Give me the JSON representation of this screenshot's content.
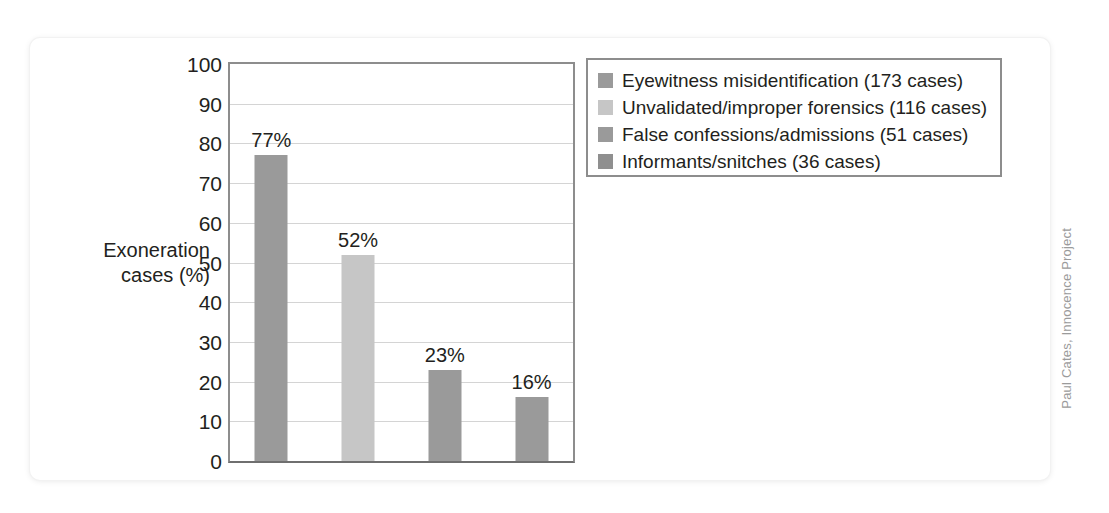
{
  "chart_data": {
    "type": "bar",
    "title": "",
    "xlabel": "",
    "ylabel": "Exoneration cases (%)",
    "ylabel_lines": [
      "Exoneration",
      "cases (%)"
    ],
    "ylim": [
      0,
      100
    ],
    "ytick_step": 10,
    "grid": true,
    "legend_position": "right-top",
    "categories": [
      "Eyewitness misidentification",
      "Unvalidated/improper forensics",
      "False confessions/admissions",
      "Informants/snitches"
    ],
    "values": [
      77,
      52,
      23,
      16
    ],
    "value_labels": [
      "77%",
      "52%",
      "23%",
      "16%"
    ],
    "case_counts": [
      173,
      116,
      51,
      36
    ],
    "yticks": [
      "100",
      "90",
      "80",
      "70",
      "60",
      "50",
      "40",
      "30",
      "20",
      "10",
      "0"
    ],
    "ytick_values": [
      100,
      90,
      80,
      70,
      60,
      50,
      40,
      30,
      20,
      10,
      0
    ],
    "bar_colors": [
      "#9a9a9a",
      "#c6c6c6",
      "#9a9a9a",
      "#9a9a9a"
    ],
    "legend": {
      "entries": [
        {
          "label": "Eyewitness misidentification (173 cases)",
          "color": "#9a9a9a"
        },
        {
          "label": "Unvalidated/improper forensics (116 cases)",
          "color": "#c6c6c6"
        },
        {
          "label": "False confessions/admissions (51 cases)",
          "color": "#9a9a9a"
        },
        {
          "label": "Informants/snitches (36 cases)",
          "color": "#8f8f8f"
        }
      ]
    }
  },
  "credit": {
    "text": "Paul Cates, Innocence Project"
  },
  "colors": {
    "axis": "#8d8d8d",
    "grid": "#d4d4d4",
    "text": "#231f20",
    "bar_dark": "#9a9a9a",
    "bar_light": "#c6c6c6",
    "credit": "#9b9b9b"
  }
}
